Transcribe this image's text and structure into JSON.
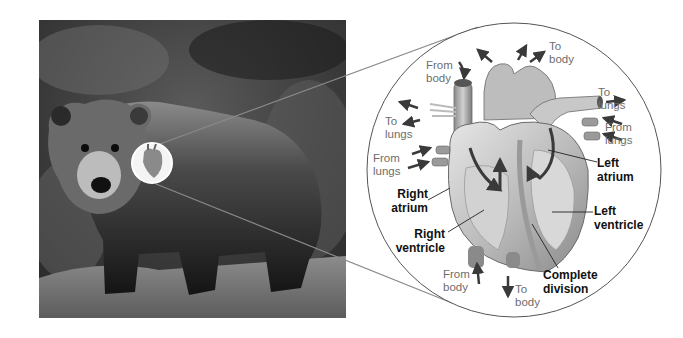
{
  "figure": {
    "photo": {
      "subject": "brown bear",
      "alt": "Bear standing on grassy ground"
    },
    "inset": {
      "subject": "mammalian heart, four chambers"
    }
  },
  "labels": {
    "from_body_top": "From\nbody",
    "to_body_top": "To\nbody",
    "to_lungs_right": "To\nlungs",
    "from_lungs_right": "From\nlungs",
    "to_lungs_left": "To\nlungs",
    "from_lungs_left": "From\nlungs",
    "left_atrium": "Left\natrium",
    "right_atrium": "Right\natrium",
    "left_ventricle": "Left\nventricle",
    "right_ventricle": "Right\nventricle",
    "from_body_bottom": "From\nbody",
    "to_body_bottom": "To\nbody",
    "complete_division": "Complete\ndivision"
  },
  "colors": {
    "background": "#ffffff",
    "flow_label": "#6d6d6d",
    "structure_label": "#111111",
    "arrow": "#3a3a3a",
    "callout_line": "#6a6a6a"
  }
}
